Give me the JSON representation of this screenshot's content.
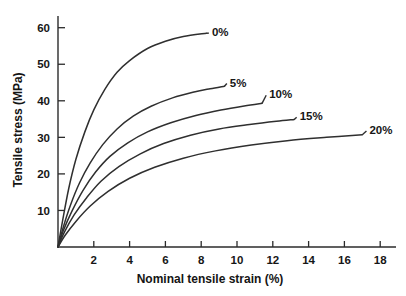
{
  "chart_data": {
    "type": "line",
    "title": "",
    "xlabel": "Nominal tensile strain (%)",
    "ylabel": "Tensile stress (MPa)",
    "xlim": [
      0,
      19
    ],
    "ylim": [
      0,
      64
    ],
    "xticks": [
      2,
      4,
      6,
      8,
      10,
      12,
      14,
      16,
      18
    ],
    "yticks": [
      10,
      20,
      30,
      40,
      50,
      60
    ],
    "xtick_labels": [
      "2",
      "4",
      "6",
      "8",
      "10",
      "12",
      "14",
      "16",
      "18"
    ],
    "ytick_labels": [
      "10",
      "20",
      "30",
      "40",
      "50",
      "60"
    ],
    "grid": false,
    "legend_position": "inline-right-of-curve-ends",
    "series": [
      {
        "name": "0%",
        "label": "0%",
        "label_x": 8.6,
        "label_y": 58.8,
        "points": [
          {
            "x": 0.0,
            "y": 0.0
          },
          {
            "x": 0.25,
            "y": 7.0
          },
          {
            "x": 0.6,
            "y": 16.0
          },
          {
            "x": 1.0,
            "y": 24.0
          },
          {
            "x": 1.5,
            "y": 31.5
          },
          {
            "x": 2.0,
            "y": 37.5
          },
          {
            "x": 2.6,
            "y": 43.0
          },
          {
            "x": 3.3,
            "y": 47.8
          },
          {
            "x": 4.0,
            "y": 51.0
          },
          {
            "x": 5.0,
            "y": 54.3
          },
          {
            "x": 6.0,
            "y": 56.3
          },
          {
            "x": 7.0,
            "y": 57.6
          },
          {
            "x": 8.3,
            "y": 58.5
          }
        ]
      },
      {
        "name": "5%",
        "label": "5%",
        "label_x": 9.6,
        "label_y": 45.0,
        "points": [
          {
            "x": 0.0,
            "y": 0.0
          },
          {
            "x": 0.3,
            "y": 5.5
          },
          {
            "x": 0.7,
            "y": 11.5
          },
          {
            "x": 1.2,
            "y": 17.5
          },
          {
            "x": 1.8,
            "y": 23.0
          },
          {
            "x": 2.5,
            "y": 28.0
          },
          {
            "x": 3.3,
            "y": 32.3
          },
          {
            "x": 4.2,
            "y": 35.8
          },
          {
            "x": 5.2,
            "y": 38.5
          },
          {
            "x": 6.4,
            "y": 40.8
          },
          {
            "x": 7.6,
            "y": 42.4
          },
          {
            "x": 8.5,
            "y": 43.3
          },
          {
            "x": 9.3,
            "y": 44.0
          }
        ]
      },
      {
        "name": "10%",
        "label": "10%",
        "label_x": 11.8,
        "label_y": 41.8,
        "points": [
          {
            "x": 0.0,
            "y": 0.0
          },
          {
            "x": 0.3,
            "y": 4.5
          },
          {
            "x": 0.8,
            "y": 10.0
          },
          {
            "x": 1.4,
            "y": 15.5
          },
          {
            "x": 2.1,
            "y": 20.5
          },
          {
            "x": 2.9,
            "y": 24.8
          },
          {
            "x": 3.9,
            "y": 28.5
          },
          {
            "x": 5.0,
            "y": 31.5
          },
          {
            "x": 6.3,
            "y": 34.0
          },
          {
            "x": 7.7,
            "y": 36.0
          },
          {
            "x": 9.1,
            "y": 37.5
          },
          {
            "x": 10.4,
            "y": 38.6
          },
          {
            "x": 11.4,
            "y": 39.3
          }
        ]
      },
      {
        "name": "15%",
        "label": "15%",
        "label_x": 13.5,
        "label_y": 35.8,
        "points": [
          {
            "x": 0.0,
            "y": 0.0
          },
          {
            "x": 0.35,
            "y": 4.0
          },
          {
            "x": 0.9,
            "y": 8.8
          },
          {
            "x": 1.6,
            "y": 13.5
          },
          {
            "x": 2.4,
            "y": 18.0
          },
          {
            "x": 3.4,
            "y": 22.0
          },
          {
            "x": 4.6,
            "y": 25.5
          },
          {
            "x": 5.9,
            "y": 28.3
          },
          {
            "x": 7.4,
            "y": 30.6
          },
          {
            "x": 9.0,
            "y": 32.3
          },
          {
            "x": 10.7,
            "y": 33.5
          },
          {
            "x": 12.2,
            "y": 34.4
          },
          {
            "x": 13.2,
            "y": 34.9
          }
        ]
      },
      {
        "name": "20%",
        "label": "20%",
        "label_x": 17.4,
        "label_y": 32.0,
        "points": [
          {
            "x": 0.0,
            "y": 0.0
          },
          {
            "x": 0.4,
            "y": 3.2
          },
          {
            "x": 1.0,
            "y": 7.0
          },
          {
            "x": 1.8,
            "y": 11.2
          },
          {
            "x": 2.8,
            "y": 15.2
          },
          {
            "x": 4.0,
            "y": 18.8
          },
          {
            "x": 5.4,
            "y": 21.8
          },
          {
            "x": 7.0,
            "y": 24.3
          },
          {
            "x": 8.8,
            "y": 26.3
          },
          {
            "x": 10.8,
            "y": 27.9
          },
          {
            "x": 12.8,
            "y": 29.1
          },
          {
            "x": 15.0,
            "y": 30.0
          },
          {
            "x": 17.0,
            "y": 30.7
          }
        ]
      }
    ]
  }
}
